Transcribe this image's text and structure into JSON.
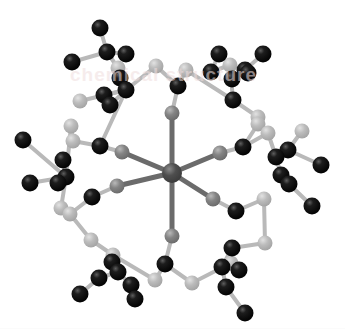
{
  "figure": {
    "background_color": "#ffffff",
    "watermark_text": "chemical structure",
    "watermark_color": "#f0dede"
  },
  "legend": {
    "metal_label": "metal center",
    "donor_label": "donor atom",
    "carbon_label": "carbon",
    "light_label": "backbone atom"
  },
  "palette": {
    "carbon": "#0b0b0b",
    "carbon_highlight": "#6f6f6f",
    "metal": "#4a4a4a",
    "donor": "#7d7d7d",
    "backbone": "#b4b4b4",
    "bond_dark": "#6b6b6b",
    "bond_light": "#b9b9b9",
    "background": "#ffffff"
  },
  "chart_data": {
    "type": "scatter",
    "xlabel": "",
    "ylabel": "",
    "xlim": [
      0,
      345
    ],
    "ylim": [
      0,
      330
    ],
    "grid": false,
    "legend_position": "none",
    "atom_types": [
      {
        "name": "metal",
        "color": "#4a4a4a",
        "radius": 9
      },
      {
        "name": "donor",
        "color": "#7d7d7d",
        "radius": 7
      },
      {
        "name": "carbon",
        "color": "#0b0b0b",
        "radius": 8
      },
      {
        "name": "backbone",
        "color": "#b4b4b4",
        "radius": 7
      }
    ],
    "atoms": [
      {
        "id": 0,
        "x": 172,
        "y": 173,
        "r": 10,
        "t": "metal"
      },
      {
        "id": 1,
        "x": 172,
        "y": 113,
        "r": 7.5,
        "t": "donor"
      },
      {
        "id": 2,
        "x": 172,
        "y": 236,
        "r": 7.5,
        "t": "donor"
      },
      {
        "id": 3,
        "x": 122,
        "y": 152,
        "r": 7.5,
        "t": "donor"
      },
      {
        "id": 4,
        "x": 220,
        "y": 153,
        "r": 7.5,
        "t": "donor"
      },
      {
        "id": 5,
        "x": 117,
        "y": 186,
        "r": 7.5,
        "t": "donor"
      },
      {
        "id": 6,
        "x": 213,
        "y": 199,
        "r": 7.5,
        "t": "donor"
      },
      {
        "id": 10,
        "x": 178,
        "y": 86,
        "r": 8.5,
        "t": "carbon"
      },
      {
        "id": 11,
        "x": 156,
        "y": 66,
        "r": 7.5,
        "t": "backbone"
      },
      {
        "id": 12,
        "x": 186,
        "y": 70,
        "r": 7.5,
        "t": "backbone"
      },
      {
        "id": 13,
        "x": 100,
        "y": 146,
        "r": 8.5,
        "t": "carbon"
      },
      {
        "id": 14,
        "x": 73,
        "y": 141,
        "r": 7.5,
        "t": "backbone"
      },
      {
        "id": 15,
        "x": 92,
        "y": 197,
        "r": 8.5,
        "t": "carbon"
      },
      {
        "id": 16,
        "x": 70,
        "y": 214,
        "r": 7.5,
        "t": "backbone"
      },
      {
        "id": 17,
        "x": 243,
        "y": 147,
        "r": 8.5,
        "t": "carbon"
      },
      {
        "id": 18,
        "x": 258,
        "y": 124,
        "r": 7.5,
        "t": "backbone"
      },
      {
        "id": 19,
        "x": 236,
        "y": 211,
        "r": 8.5,
        "t": "carbon"
      },
      {
        "id": 20,
        "x": 264,
        "y": 199,
        "r": 7.5,
        "t": "backbone"
      },
      {
        "id": 21,
        "x": 165,
        "y": 264,
        "r": 8.5,
        "t": "carbon"
      },
      {
        "id": 22,
        "x": 155,
        "y": 280,
        "r": 7.5,
        "t": "backbone"
      },
      {
        "id": 23,
        "x": 192,
        "y": 283,
        "r": 7.5,
        "t": "backbone"
      },
      {
        "id": 30,
        "x": 120,
        "y": 78,
        "r": 8.5,
        "t": "carbon"
      },
      {
        "id": 31,
        "x": 104,
        "y": 95,
        "r": 8.5,
        "t": "carbon"
      },
      {
        "id": 32,
        "x": 110,
        "y": 105,
        "r": 8.5,
        "t": "carbon"
      },
      {
        "id": 33,
        "x": 100,
        "y": 28,
        "r": 8.5,
        "t": "carbon"
      },
      {
        "id": 34,
        "x": 107,
        "y": 52,
        "r": 8.5,
        "t": "carbon"
      },
      {
        "id": 35,
        "x": 126,
        "y": 54,
        "r": 8.5,
        "t": "carbon"
      },
      {
        "id": 36,
        "x": 72,
        "y": 62,
        "r": 8.5,
        "t": "carbon"
      },
      {
        "id": 37,
        "x": 80,
        "y": 101,
        "r": 7.5,
        "t": "backbone"
      },
      {
        "id": 38,
        "x": 118,
        "y": 68,
        "r": 7.5,
        "t": "backbone"
      },
      {
        "id": 39,
        "x": 126,
        "y": 90,
        "r": 8.5,
        "t": "carbon"
      },
      {
        "id": 40,
        "x": 219,
        "y": 54,
        "r": 8.5,
        "t": "carbon"
      },
      {
        "id": 41,
        "x": 211,
        "y": 72,
        "r": 8.5,
        "t": "carbon"
      },
      {
        "id": 42,
        "x": 232,
        "y": 79,
        "r": 8.5,
        "t": "carbon"
      },
      {
        "id": 43,
        "x": 245,
        "y": 70,
        "r": 8.5,
        "t": "carbon"
      },
      {
        "id": 44,
        "x": 248,
        "y": 73,
        "r": 8.5,
        "t": "carbon"
      },
      {
        "id": 45,
        "x": 263,
        "y": 54,
        "r": 8.5,
        "t": "carbon"
      },
      {
        "id": 46,
        "x": 233,
        "y": 100,
        "r": 8.5,
        "t": "carbon"
      },
      {
        "id": 47,
        "x": 230,
        "y": 65,
        "r": 7.5,
        "t": "backbone"
      },
      {
        "id": 48,
        "x": 258,
        "y": 117,
        "r": 7.5,
        "t": "backbone"
      },
      {
        "id": 50,
        "x": 63,
        "y": 160,
        "r": 8.5,
        "t": "carbon"
      },
      {
        "id": 51,
        "x": 58,
        "y": 183,
        "r": 8.5,
        "t": "carbon"
      },
      {
        "id": 52,
        "x": 66,
        "y": 177,
        "r": 8.5,
        "t": "carbon"
      },
      {
        "id": 53,
        "x": 23,
        "y": 140,
        "r": 8.5,
        "t": "carbon"
      },
      {
        "id": 54,
        "x": 30,
        "y": 183,
        "r": 8.5,
        "t": "carbon"
      },
      {
        "id": 55,
        "x": 61,
        "y": 208,
        "r": 7.5,
        "t": "backbone"
      },
      {
        "id": 56,
        "x": 71,
        "y": 126,
        "r": 7.5,
        "t": "backbone"
      },
      {
        "id": 60,
        "x": 276,
        "y": 157,
        "r": 8.5,
        "t": "carbon"
      },
      {
        "id": 61,
        "x": 288,
        "y": 150,
        "r": 8.5,
        "t": "carbon"
      },
      {
        "id": 62,
        "x": 281,
        "y": 175,
        "r": 8.5,
        "t": "carbon"
      },
      {
        "id": 63,
        "x": 289,
        "y": 184,
        "r": 8.5,
        "t": "carbon"
      },
      {
        "id": 64,
        "x": 321,
        "y": 165,
        "r": 8.5,
        "t": "carbon"
      },
      {
        "id": 65,
        "x": 312,
        "y": 206,
        "r": 8.5,
        "t": "carbon"
      },
      {
        "id": 66,
        "x": 268,
        "y": 133,
        "r": 7.5,
        "t": "backbone"
      },
      {
        "id": 67,
        "x": 302,
        "y": 131,
        "r": 7.5,
        "t": "backbone"
      },
      {
        "id": 70,
        "x": 112,
        "y": 262,
        "r": 8.5,
        "t": "carbon"
      },
      {
        "id": 71,
        "x": 99,
        "y": 278,
        "r": 8.5,
        "t": "carbon"
      },
      {
        "id": 72,
        "x": 118,
        "y": 272,
        "r": 8.5,
        "t": "carbon"
      },
      {
        "id": 73,
        "x": 131,
        "y": 285,
        "r": 8.5,
        "t": "carbon"
      },
      {
        "id": 74,
        "x": 80,
        "y": 294,
        "r": 8.5,
        "t": "carbon"
      },
      {
        "id": 75,
        "x": 135,
        "y": 299,
        "r": 8.5,
        "t": "carbon"
      },
      {
        "id": 76,
        "x": 113,
        "y": 255,
        "r": 7.5,
        "t": "backbone"
      },
      {
        "id": 77,
        "x": 91,
        "y": 240,
        "r": 7.5,
        "t": "backbone"
      },
      {
        "id": 80,
        "x": 232,
        "y": 248,
        "r": 8.5,
        "t": "carbon"
      },
      {
        "id": 81,
        "x": 222,
        "y": 267,
        "r": 8.5,
        "t": "carbon"
      },
      {
        "id": 82,
        "x": 239,
        "y": 270,
        "r": 8.5,
        "t": "carbon"
      },
      {
        "id": 83,
        "x": 226,
        "y": 287,
        "r": 8.5,
        "t": "carbon"
      },
      {
        "id": 84,
        "x": 245,
        "y": 313,
        "r": 8.5,
        "t": "carbon"
      },
      {
        "id": 85,
        "x": 265,
        "y": 243,
        "r": 7.5,
        "t": "backbone"
      },
      {
        "id": 86,
        "x": 231,
        "y": 263,
        "r": 7.5,
        "t": "backbone"
      }
    ],
    "bonds": [
      {
        "a": 0,
        "b": 1,
        "w": 5,
        "c": "dark"
      },
      {
        "a": 0,
        "b": 2,
        "w": 5,
        "c": "dark"
      },
      {
        "a": 0,
        "b": 3,
        "w": 5,
        "c": "dark"
      },
      {
        "a": 0,
        "b": 4,
        "w": 5,
        "c": "dark"
      },
      {
        "a": 0,
        "b": 5,
        "w": 5,
        "c": "dark"
      },
      {
        "a": 0,
        "b": 6,
        "w": 5,
        "c": "dark"
      },
      {
        "a": 1,
        "b": 10,
        "w": 4,
        "c": "light"
      },
      {
        "a": 10,
        "b": 11,
        "w": 4,
        "c": "light"
      },
      {
        "a": 10,
        "b": 12,
        "w": 4,
        "c": "light"
      },
      {
        "a": 11,
        "b": 39,
        "w": 4,
        "c": "light"
      },
      {
        "a": 12,
        "b": 46,
        "w": 4,
        "c": "light"
      },
      {
        "a": 3,
        "b": 13,
        "w": 4,
        "c": "light"
      },
      {
        "a": 13,
        "b": 14,
        "w": 4,
        "c": "light"
      },
      {
        "a": 14,
        "b": 56,
        "w": 4,
        "c": "light"
      },
      {
        "a": 13,
        "b": 39,
        "w": 4,
        "c": "light"
      },
      {
        "a": 5,
        "b": 15,
        "w": 4,
        "c": "light"
      },
      {
        "a": 15,
        "b": 16,
        "w": 4,
        "c": "light"
      },
      {
        "a": 16,
        "b": 55,
        "w": 4,
        "c": "light"
      },
      {
        "a": 16,
        "b": 77,
        "w": 4,
        "c": "light"
      },
      {
        "a": 4,
        "b": 17,
        "w": 4,
        "c": "light"
      },
      {
        "a": 17,
        "b": 18,
        "w": 4,
        "c": "light"
      },
      {
        "a": 18,
        "b": 48,
        "w": 4,
        "c": "light"
      },
      {
        "a": 17,
        "b": 66,
        "w": 4,
        "c": "light"
      },
      {
        "a": 6,
        "b": 19,
        "w": 4,
        "c": "light"
      },
      {
        "a": 19,
        "b": 20,
        "w": 4,
        "c": "light"
      },
      {
        "a": 20,
        "b": 85,
        "w": 4,
        "c": "light"
      },
      {
        "a": 2,
        "b": 21,
        "w": 4,
        "c": "light"
      },
      {
        "a": 21,
        "b": 22,
        "w": 4,
        "c": "light"
      },
      {
        "a": 21,
        "b": 23,
        "w": 4,
        "c": "light"
      },
      {
        "a": 22,
        "b": 76,
        "w": 4,
        "c": "light"
      },
      {
        "a": 23,
        "b": 86,
        "w": 4,
        "c": "light"
      },
      {
        "a": 39,
        "b": 38,
        "w": 4,
        "c": "light"
      },
      {
        "a": 38,
        "b": 34,
        "w": 4,
        "c": "light"
      },
      {
        "a": 34,
        "b": 33,
        "w": 4,
        "c": "light"
      },
      {
        "a": 34,
        "b": 35,
        "w": 4,
        "c": "light"
      },
      {
        "a": 34,
        "b": 36,
        "w": 4,
        "c": "light"
      },
      {
        "a": 39,
        "b": 30,
        "w": 4,
        "c": "light"
      },
      {
        "a": 39,
        "b": 31,
        "w": 4,
        "c": "light"
      },
      {
        "a": 39,
        "b": 32,
        "w": 4,
        "c": "light"
      },
      {
        "a": 39,
        "b": 37,
        "w": 4,
        "c": "light"
      },
      {
        "a": 46,
        "b": 47,
        "w": 4,
        "c": "light"
      },
      {
        "a": 47,
        "b": 41,
        "w": 4,
        "c": "light"
      },
      {
        "a": 41,
        "b": 40,
        "w": 4,
        "c": "light"
      },
      {
        "a": 47,
        "b": 42,
        "w": 4,
        "c": "light"
      },
      {
        "a": 42,
        "b": 43,
        "w": 4,
        "c": "light"
      },
      {
        "a": 43,
        "b": 45,
        "w": 4,
        "c": "light"
      },
      {
        "a": 46,
        "b": 48,
        "w": 4,
        "c": "light"
      },
      {
        "a": 42,
        "b": 44,
        "w": 4,
        "c": "light"
      },
      {
        "a": 56,
        "b": 52,
        "w": 4,
        "c": "light"
      },
      {
        "a": 52,
        "b": 50,
        "w": 4,
        "c": "light"
      },
      {
        "a": 52,
        "b": 51,
        "w": 4,
        "c": "light"
      },
      {
        "a": 52,
        "b": 53,
        "w": 4,
        "c": "light"
      },
      {
        "a": 52,
        "b": 54,
        "w": 4,
        "c": "light"
      },
      {
        "a": 52,
        "b": 55,
        "w": 4,
        "c": "light"
      },
      {
        "a": 66,
        "b": 60,
        "w": 4,
        "c": "light"
      },
      {
        "a": 60,
        "b": 61,
        "w": 4,
        "c": "light"
      },
      {
        "a": 60,
        "b": 62,
        "w": 4,
        "c": "light"
      },
      {
        "a": 62,
        "b": 63,
        "w": 4,
        "c": "light"
      },
      {
        "a": 61,
        "b": 64,
        "w": 4,
        "c": "light"
      },
      {
        "a": 63,
        "b": 65,
        "w": 4,
        "c": "light"
      },
      {
        "a": 61,
        "b": 67,
        "w": 4,
        "c": "light"
      },
      {
        "a": 76,
        "b": 72,
        "w": 4,
        "c": "light"
      },
      {
        "a": 72,
        "b": 70,
        "w": 4,
        "c": "light"
      },
      {
        "a": 72,
        "b": 71,
        "w": 4,
        "c": "light"
      },
      {
        "a": 72,
        "b": 73,
        "w": 4,
        "c": "light"
      },
      {
        "a": 71,
        "b": 74,
        "w": 4,
        "c": "light"
      },
      {
        "a": 73,
        "b": 75,
        "w": 4,
        "c": "light"
      },
      {
        "a": 76,
        "b": 77,
        "w": 4,
        "c": "light"
      },
      {
        "a": 86,
        "b": 81,
        "w": 4,
        "c": "light"
      },
      {
        "a": 81,
        "b": 80,
        "w": 4,
        "c": "light"
      },
      {
        "a": 81,
        "b": 82,
        "w": 4,
        "c": "light"
      },
      {
        "a": 81,
        "b": 83,
        "w": 4,
        "c": "light"
      },
      {
        "a": 83,
        "b": 84,
        "w": 4,
        "c": "light"
      },
      {
        "a": 80,
        "b": 85,
        "w": 4,
        "c": "light"
      }
    ]
  }
}
